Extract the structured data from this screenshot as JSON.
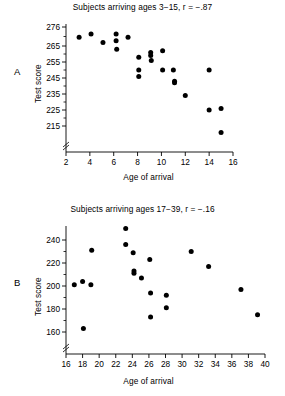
{
  "figure": {
    "panels": [
      {
        "letter": "A",
        "title": "Subjects arriving ages 3−15, r = −.87",
        "xlabel": "Age of arrival",
        "ylabel": "Test score"
      },
      {
        "letter": "B",
        "title": "Subjects arriving ages 17−39, r = −.16",
        "xlabel": "Age of arrival",
        "ylabel": "Test score"
      }
    ]
  },
  "chart_data": [
    {
      "type": "scatter",
      "panel": "A",
      "title": "Subjects arriving ages 3−15, r = −.87",
      "xlabel": "Age of arrival",
      "ylabel": "Test score",
      "xlim": [
        2,
        16
      ],
      "ylim": [
        210,
        276
      ],
      "xticks": [
        2,
        4,
        6,
        8,
        10,
        12,
        14,
        16
      ],
      "yticks": [
        215,
        225,
        235,
        245,
        255,
        265,
        276
      ],
      "ytick_labels": [
        "215",
        "225",
        "235",
        "245",
        "255",
        "265",
        "276"
      ],
      "xtick_labels": [
        "2",
        "4",
        "6",
        "8",
        "10",
        "12",
        "14",
        "16"
      ],
      "axis_break": true,
      "grid": false,
      "legend": "none",
      "correlation": -0.87,
      "points": [
        {
          "x": 3.1,
          "y": 270
        },
        {
          "x": 4.1,
          "y": 272
        },
        {
          "x": 5.1,
          "y": 267
        },
        {
          "x": 6.2,
          "y": 272
        },
        {
          "x": 6.2,
          "y": 268
        },
        {
          "x": 6.25,
          "y": 263
        },
        {
          "x": 7.2,
          "y": 270
        },
        {
          "x": 8.1,
          "y": 258
        },
        {
          "x": 8.1,
          "y": 250
        },
        {
          "x": 8.1,
          "y": 246
        },
        {
          "x": 9.1,
          "y": 261
        },
        {
          "x": 9.1,
          "y": 259
        },
        {
          "x": 9.15,
          "y": 256
        },
        {
          "x": 10.1,
          "y": 262
        },
        {
          "x": 10.1,
          "y": 250
        },
        {
          "x": 11.0,
          "y": 250
        },
        {
          "x": 11.1,
          "y": 243
        },
        {
          "x": 11.1,
          "y": 242
        },
        {
          "x": 12.0,
          "y": 234
        },
        {
          "x": 14.0,
          "y": 250
        },
        {
          "x": 14.0,
          "y": 225
        },
        {
          "x": 15.0,
          "y": 226
        },
        {
          "x": 15.0,
          "y": 211
        }
      ]
    },
    {
      "type": "scatter",
      "panel": "B",
      "title": "Subjects arriving ages 17−39, r = −.16",
      "xlabel": "Age of arrival",
      "ylabel": "Test score",
      "xlim": [
        16,
        40
      ],
      "ylim": [
        152,
        252
      ],
      "xticks": [
        16,
        18,
        20,
        22,
        24,
        26,
        28,
        30,
        32,
        34,
        36,
        38,
        40
      ],
      "yticks": [
        160,
        180,
        200,
        220,
        240
      ],
      "ytick_labels": [
        "160",
        "180",
        "200",
        "220",
        "240"
      ],
      "xtick_labels": [
        "16",
        "18",
        "20",
        "22",
        "24",
        "26",
        "28",
        "30",
        "32",
        "34",
        "36",
        "38",
        "40"
      ],
      "axis_break": true,
      "grid": false,
      "legend": "none",
      "correlation": -0.16,
      "points": [
        {
          "x": 17.0,
          "y": 201
        },
        {
          "x": 18.0,
          "y": 204
        },
        {
          "x": 18.1,
          "y": 163
        },
        {
          "x": 19.0,
          "y": 201
        },
        {
          "x": 19.1,
          "y": 231
        },
        {
          "x": 23.2,
          "y": 250
        },
        {
          "x": 23.2,
          "y": 236
        },
        {
          "x": 24.1,
          "y": 229
        },
        {
          "x": 24.2,
          "y": 213
        },
        {
          "x": 24.2,
          "y": 211
        },
        {
          "x": 25.1,
          "y": 207
        },
        {
          "x": 26.1,
          "y": 223
        },
        {
          "x": 26.2,
          "y": 194
        },
        {
          "x": 26.2,
          "y": 173
        },
        {
          "x": 28.1,
          "y": 192
        },
        {
          "x": 28.1,
          "y": 181
        },
        {
          "x": 31.1,
          "y": 230
        },
        {
          "x": 33.2,
          "y": 217
        },
        {
          "x": 37.1,
          "y": 197
        },
        {
          "x": 39.1,
          "y": 175
        }
      ]
    }
  ]
}
